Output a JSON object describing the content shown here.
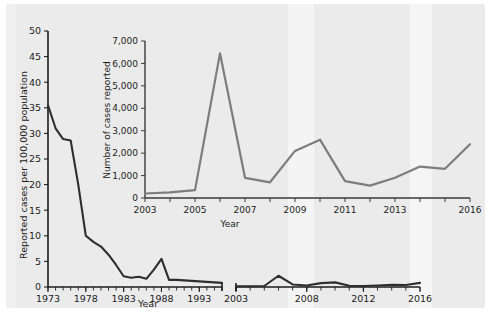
{
  "figure": {
    "background_color": "#ebebeb",
    "page_color": "#ffffff"
  },
  "chart_data": [
    {
      "id": "main",
      "type": "line",
      "title": "",
      "xlabel": "Year",
      "ylabel": "Reported cases per 100,000 population",
      "ylim": [
        0,
        50
      ],
      "ytick_values": [
        0,
        5,
        10,
        15,
        20,
        25,
        30,
        35,
        40,
        45,
        50
      ],
      "ytick_labels": [
        "0",
        "5",
        "10",
        "15",
        "20",
        "25",
        "30",
        "35",
        "40",
        "45",
        "50"
      ],
      "xtick_labels": [
        "1973",
        "1978",
        "1983",
        "1988",
        "1993",
        "2003",
        "2008",
        "2012",
        "2016"
      ],
      "xtick_values": [
        1973,
        1978,
        1983,
        1988,
        1993,
        2003,
        2008,
        2012,
        2016
      ],
      "axis_break": true,
      "axis_break_between": [
        1996,
        2002
      ],
      "grid": false,
      "legend": "none",
      "line_color": "#2e2e2e",
      "segments": [
        {
          "name": "1973-1996",
          "x": [
            1973,
            1974,
            1975,
            1976,
            1977,
            1978,
            1979,
            1980,
            1981,
            1982,
            1983,
            1984,
            1985,
            1986,
            1987,
            1988,
            1989,
            1990,
            1991,
            1992,
            1993,
            1994,
            1995,
            1996
          ],
          "y": [
            35.5,
            31.0,
            28.9,
            28.6,
            20.0,
            10.0,
            8.8,
            7.9,
            6.3,
            4.3,
            2.1,
            1.8,
            2.0,
            1.6,
            3.4,
            5.5,
            1.4,
            1.4,
            1.3,
            1.2,
            1.1,
            1.0,
            0.9,
            0.8
          ]
        },
        {
          "name": "2003-2016",
          "x": [
            2003,
            2004,
            2005,
            2006,
            2007,
            2008,
            2009,
            2010,
            2011,
            2012,
            2013,
            2014,
            2015,
            2016
          ],
          "y": [
            0.15,
            0.15,
            0.2,
            2.2,
            0.5,
            0.3,
            0.75,
            0.9,
            0.25,
            0.2,
            0.3,
            0.45,
            0.4,
            0.8
          ]
        }
      ]
    },
    {
      "id": "inset",
      "type": "line",
      "title": "",
      "xlabel": "Year",
      "ylabel": "Number of cases reported",
      "ylim": [
        0,
        7000
      ],
      "ytick_values": [
        0,
        1000,
        2000,
        3000,
        4000,
        5000,
        6000,
        7000
      ],
      "ytick_labels": [
        "0",
        "1,000",
        "2,000",
        "3,000",
        "4,000",
        "5,000",
        "6,000",
        "7,000"
      ],
      "xtick_labels": [
        "2003",
        "2005",
        "2007",
        "2009",
        "2011",
        "2013",
        "2016"
      ],
      "xtick_values": [
        2003,
        2005,
        2007,
        2009,
        2011,
        2013,
        2016
      ],
      "xlim": [
        2003,
        2016
      ],
      "grid": false,
      "legend": "none",
      "line_color": "#7d7d7d",
      "series": [
        {
          "name": "Number of cases reported",
          "x": [
            2003,
            2004,
            2005,
            2006,
            2007,
            2008,
            2009,
            2010,
            2011,
            2012,
            2013,
            2014,
            2015,
            2016
          ],
          "y": [
            200,
            250,
            350,
            6450,
            900,
            700,
            2100,
            2600,
            750,
            550,
            900,
            1400,
            1300,
            2400
          ]
        }
      ]
    }
  ]
}
